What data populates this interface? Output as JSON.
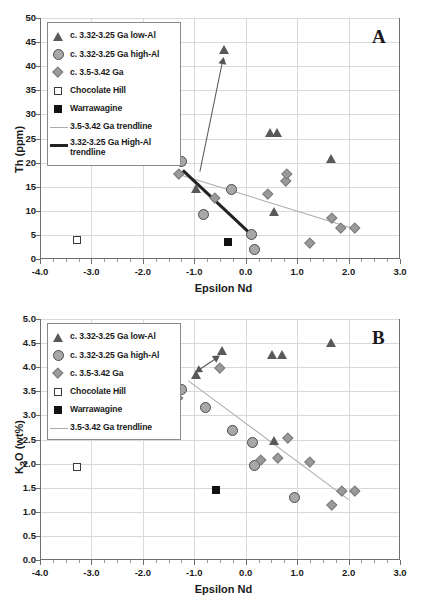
{
  "figure": {
    "caption": "",
    "panels": [
      "A",
      "B"
    ]
  },
  "chart_data": [
    {
      "type": "scatter",
      "panel_label": "A",
      "title": "",
      "xlabel": "Epsilon Nd",
      "ylabel": "Th (ppm)",
      "xlim": [
        -4.0,
        3.0
      ],
      "ylim": [
        0,
        50
      ],
      "xticks": [
        "-4.0",
        "-3.0",
        "-2.0",
        "-1.0",
        "0.0",
        "1.0",
        "2.0",
        "3.0"
      ],
      "yticks": [
        "0",
        "5",
        "10",
        "15",
        "20",
        "25",
        "30",
        "35",
        "40",
        "45",
        "50"
      ],
      "grid": true,
      "legend_position": "top-left",
      "legend": [
        {
          "label": "c. 3.32-3.25 Ga low-Al",
          "marker": "triangle"
        },
        {
          "label": "c. 3.32-3.25 Ga high-Al",
          "marker": "circle"
        },
        {
          "label": "c. 3.5-3.42 Ga",
          "marker": "diamond"
        },
        {
          "label": "Chocolate Hill",
          "marker": "square-open"
        },
        {
          "label": "Warrawagine",
          "marker": "square-filled"
        },
        {
          "label": "3.5-3.42 Ga trendline",
          "marker": "line-light"
        },
        {
          "label": "3.32-3.25 Ga High-Al trendline",
          "marker": "line-dark"
        }
      ],
      "series": [
        {
          "name": "c. 3.32-3.25 Ga low-Al",
          "marker": "triangle",
          "points": [
            [
              -0.42,
              43.5
            ],
            [
              -0.97,
              14.7
            ],
            [
              0.47,
              26.3
            ],
            [
              0.62,
              26.2
            ],
            [
              1.67,
              20.9
            ],
            [
              0.55,
              9.8
            ]
          ]
        },
        {
          "name": "c. 3.32-3.25 Ga high-Al",
          "marker": "circle",
          "points": [
            [
              -1.25,
              20.2
            ],
            [
              -0.82,
              9.2
            ],
            [
              -0.28,
              14.5
            ],
            [
              0.12,
              5.1
            ],
            [
              0.17,
              2.0
            ]
          ]
        },
        {
          "name": "c. 3.5-3.42 Ga",
          "marker": "diamond",
          "points": [
            [
              -1.3,
              17.7
            ],
            [
              -0.6,
              12.7
            ],
            [
              0.42,
              13.5
            ],
            [
              0.78,
              16.3
            ],
            [
              0.8,
              17.6
            ],
            [
              1.25,
              3.3
            ],
            [
              1.67,
              8.6
            ],
            [
              1.85,
              6.5
            ],
            [
              2.12,
              6.4
            ]
          ]
        },
        {
          "name": "Chocolate Hill",
          "marker": "square-open",
          "points": [
            [
              -3.28,
              3.9
            ]
          ]
        },
        {
          "name": "Warrawagine",
          "marker": "square-filled",
          "points": [
            [
              -0.35,
              3.6
            ]
          ]
        }
      ],
      "trendlines": [
        {
          "name": "3.5-3.42 Ga trendline",
          "style": "light",
          "from": [
            -1.3,
            17.7
          ],
          "to": [
            2.12,
            6.4
          ]
        },
        {
          "name": "3.32-3.25 Ga High-Al trendline",
          "style": "dark",
          "from": [
            -1.22,
            18.6
          ],
          "to": [
            0.14,
            5.0
          ]
        }
      ],
      "annotations": [
        {
          "type": "arrow",
          "from": [
            -0.88,
            18.3
          ],
          "to": [
            -0.44,
            41.2
          ],
          "doubleheaded": false
        }
      ]
    },
    {
      "type": "scatter",
      "panel_label": "B",
      "title": "",
      "xlabel": "Epsilon Nd",
      "ylabel": "K2O (wt%)",
      "ylabel_html": "K<sub>2</sub>O (wt%)",
      "xlim": [
        -4.0,
        3.0
      ],
      "ylim": [
        0.0,
        5.0
      ],
      "xticks": [
        "-4.0",
        "-3.0",
        "-2.0",
        "-1.0",
        "0.0",
        "1.0",
        "2.0",
        "3.0"
      ],
      "yticks": [
        "0.0",
        "0.5",
        "1.0",
        "1.5",
        "2.0",
        "2.5",
        "3.0",
        "3.5",
        "4.0",
        "4.5",
        "5.0"
      ],
      "grid": true,
      "legend_position": "top-left",
      "legend": [
        {
          "label": "c. 3.32-3.25 Ga low-Al",
          "marker": "triangle"
        },
        {
          "label": "c. 3.32-3.25 Ga high-Al",
          "marker": "circle"
        },
        {
          "label": "c. 3.5-3.42 Ga",
          "marker": "diamond"
        },
        {
          "label": "Chocolate Hill",
          "marker": "square-open"
        },
        {
          "label": "Warrawagine",
          "marker": "square-filled"
        },
        {
          "label": "3.5-3.42 Ga trendline",
          "marker": "line-light"
        }
      ],
      "series": [
        {
          "name": "c. 3.32-3.25 Ga low-Al",
          "marker": "triangle",
          "points": [
            [
              -0.45,
              4.34
            ],
            [
              -0.97,
              3.85
            ],
            [
              0.52,
              4.27
            ],
            [
              0.7,
              4.26
            ],
            [
              1.67,
              4.51
            ],
            [
              0.55,
              2.47
            ]
          ]
        },
        {
          "name": "c. 3.32-3.25 Ga high-Al",
          "marker": "circle",
          "points": [
            [
              -1.24,
              3.53
            ],
            [
              -0.78,
              3.16
            ],
            [
              -0.25,
              2.68
            ],
            [
              0.14,
              2.44
            ],
            [
              0.17,
              1.97
            ],
            [
              0.95,
              1.3
            ]
          ]
        },
        {
          "name": "c. 3.5-3.42 Ga",
          "marker": "diamond",
          "points": [
            [
              -1.32,
              3.37
            ],
            [
              -0.5,
              3.99
            ],
            [
              0.3,
              2.08
            ],
            [
              0.63,
              2.11
            ],
            [
              0.82,
              2.54
            ],
            [
              1.25,
              2.03
            ],
            [
              1.68,
              1.14
            ],
            [
              1.87,
              1.44
            ],
            [
              2.12,
              1.43
            ]
          ]
        },
        {
          "name": "Chocolate Hill",
          "marker": "square-open",
          "points": [
            [
              -3.28,
              1.93
            ]
          ]
        },
        {
          "name": "Warrawagine",
          "marker": "square-filled",
          "points": [
            [
              -0.57,
              1.45
            ]
          ]
        }
      ],
      "trendlines": [
        {
          "name": "3.5-3.42 Ga trendline",
          "style": "light",
          "from": [
            -1.12,
            3.74
          ],
          "to": [
            2.0,
            1.27
          ]
        }
      ],
      "annotations": [
        {
          "type": "arrow",
          "from": [
            -0.93,
            3.95
          ],
          "to": [
            -0.55,
            4.22
          ],
          "doubleheaded": true
        }
      ]
    }
  ]
}
